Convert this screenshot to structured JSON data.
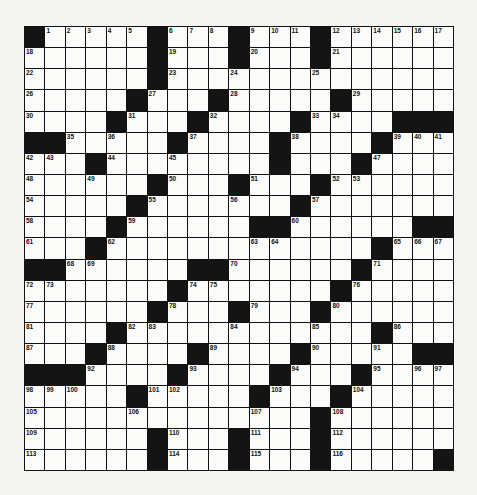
{
  "puzzle": {
    "rows": 21,
    "cols": 21,
    "grid": [
      "#.....#...#...#......",
      "......#...#...#......",
      "......#..............",
      ".....#...#.....#.....",
      "....#...#....#....###",
      "##.....#....#....#...",
      "...#........#...#....",
      "......#...#...#......",
      ".....#.......#.......",
      "....#......##......##",
      "...#.............#...",
      "##......##......#....",
      ".......#.......#.....",
      "......#...#...#......",
      "....#............#...",
      "...#....#....#.....##",
      "###....#....#...#....",
      ".....#.....#...#.....",
      "..............#......",
      "......#...#...#......",
      "......#...#...#.....#"
    ],
    "numbers": [
      {
        "r": 0,
        "c": 1,
        "n": "1"
      },
      {
        "r": 0,
        "c": 2,
        "n": "2"
      },
      {
        "r": 0,
        "c": 3,
        "n": "3"
      },
      {
        "r": 0,
        "c": 4,
        "n": "4"
      },
      {
        "r": 0,
        "c": 5,
        "n": "5"
      },
      {
        "r": 0,
        "c": 7,
        "n": "6"
      },
      {
        "r": 0,
        "c": 8,
        "n": "7"
      },
      {
        "r": 0,
        "c": 9,
        "n": "8"
      },
      {
        "r": 0,
        "c": 11,
        "n": "9"
      },
      {
        "r": 0,
        "c": 12,
        "n": "10"
      },
      {
        "r": 0,
        "c": 13,
        "n": "11"
      },
      {
        "r": 0,
        "c": 15,
        "n": "12"
      },
      {
        "r": 0,
        "c": 16,
        "n": "13"
      },
      {
        "r": 0,
        "c": 17,
        "n": "14"
      },
      {
        "r": 0,
        "c": 18,
        "n": "15"
      },
      {
        "r": 0,
        "c": 19,
        "n": "16"
      },
      {
        "r": 0,
        "c": 20,
        "n": "17"
      },
      {
        "r": 1,
        "c": 0,
        "n": "18"
      },
      {
        "r": 1,
        "c": 7,
        "n": "19"
      },
      {
        "r": 1,
        "c": 11,
        "n": "20"
      },
      {
        "r": 1,
        "c": 15,
        "n": "21"
      },
      {
        "r": 2,
        "c": 0,
        "n": "22"
      },
      {
        "r": 2,
        "c": 7,
        "n": "23"
      },
      {
        "r": 2,
        "c": 10,
        "n": "24"
      },
      {
        "r": 2,
        "c": 14,
        "n": "25"
      },
      {
        "r": 3,
        "c": 0,
        "n": "26"
      },
      {
        "r": 3,
        "c": 6,
        "n": "27"
      },
      {
        "r": 3,
        "c": 10,
        "n": "28"
      },
      {
        "r": 3,
        "c": 16,
        "n": "29"
      },
      {
        "r": 4,
        "c": 0,
        "n": "30"
      },
      {
        "r": 4,
        "c": 5,
        "n": "31"
      },
      {
        "r": 4,
        "c": 9,
        "n": "32"
      },
      {
        "r": 4,
        "c": 14,
        "n": "33"
      },
      {
        "r": 4,
        "c": 15,
        "n": "34"
      },
      {
        "r": 5,
        "c": 2,
        "n": "35"
      },
      {
        "r": 5,
        "c": 4,
        "n": "36"
      },
      {
        "r": 5,
        "c": 8,
        "n": "37"
      },
      {
        "r": 5,
        "c": 13,
        "n": "38"
      },
      {
        "r": 5,
        "c": 18,
        "n": "39"
      },
      {
        "r": 5,
        "c": 19,
        "n": "40"
      },
      {
        "r": 5,
        "c": 20,
        "n": "41"
      },
      {
        "r": 6,
        "c": 0,
        "n": "42"
      },
      {
        "r": 6,
        "c": 1,
        "n": "43"
      },
      {
        "r": 6,
        "c": 4,
        "n": "44"
      },
      {
        "r": 6,
        "c": 7,
        "n": "45"
      },
      {
        "r": 6,
        "c": 12,
        "n": "46"
      },
      {
        "r": 6,
        "c": 17,
        "n": "47"
      },
      {
        "r": 7,
        "c": 0,
        "n": "48"
      },
      {
        "r": 7,
        "c": 3,
        "n": "49"
      },
      {
        "r": 7,
        "c": 7,
        "n": "50"
      },
      {
        "r": 7,
        "c": 11,
        "n": "51"
      },
      {
        "r": 7,
        "c": 15,
        "n": "52"
      },
      {
        "r": 7,
        "c": 16,
        "n": "53"
      },
      {
        "r": 8,
        "c": 0,
        "n": "54"
      },
      {
        "r": 8,
        "c": 6,
        "n": "55"
      },
      {
        "r": 8,
        "c": 10,
        "n": "56"
      },
      {
        "r": 8,
        "c": 14,
        "n": "57"
      },
      {
        "r": 9,
        "c": 0,
        "n": "58"
      },
      {
        "r": 9,
        "c": 5,
        "n": "59"
      },
      {
        "r": 9,
        "c": 13,
        "n": "60"
      },
      {
        "r": 10,
        "c": 0,
        "n": "61"
      },
      {
        "r": 10,
        "c": 4,
        "n": "62"
      },
      {
        "r": 10,
        "c": 11,
        "n": "63"
      },
      {
        "r": 10,
        "c": 12,
        "n": "64"
      },
      {
        "r": 10,
        "c": 18,
        "n": "65"
      },
      {
        "r": 10,
        "c": 19,
        "n": "66"
      },
      {
        "r": 10,
        "c": 20,
        "n": "67"
      },
      {
        "r": 11,
        "c": 2,
        "n": "68"
      },
      {
        "r": 11,
        "c": 3,
        "n": "69"
      },
      {
        "r": 11,
        "c": 10,
        "n": "70"
      },
      {
        "r": 11,
        "c": 17,
        "n": "71"
      },
      {
        "r": 12,
        "c": 0,
        "n": "72"
      },
      {
        "r": 12,
        "c": 1,
        "n": "73"
      },
      {
        "r": 12,
        "c": 8,
        "n": "74"
      },
      {
        "r": 12,
        "c": 9,
        "n": "75"
      },
      {
        "r": 12,
        "c": 16,
        "n": "76"
      },
      {
        "r": 13,
        "c": 0,
        "n": "77"
      },
      {
        "r": 13,
        "c": 7,
        "n": "78"
      },
      {
        "r": 13,
        "c": 11,
        "n": "79"
      },
      {
        "r": 13,
        "c": 15,
        "n": "80"
      },
      {
        "r": 14,
        "c": 0,
        "n": "81"
      },
      {
        "r": 14,
        "c": 5,
        "n": "82"
      },
      {
        "r": 14,
        "c": 6,
        "n": "83"
      },
      {
        "r": 14,
        "c": 10,
        "n": "84"
      },
      {
        "r": 14,
        "c": 14,
        "n": "85"
      },
      {
        "r": 14,
        "c": 18,
        "n": "86"
      },
      {
        "r": 15,
        "c": 0,
        "n": "87"
      },
      {
        "r": 15,
        "c": 4,
        "n": "88"
      },
      {
        "r": 15,
        "c": 9,
        "n": "89"
      },
      {
        "r": 15,
        "c": 14,
        "n": "90"
      },
      {
        "r": 15,
        "c": 17,
        "n": "91"
      },
      {
        "r": 16,
        "c": 3,
        "n": "92"
      },
      {
        "r": 16,
        "c": 8,
        "n": "93"
      },
      {
        "r": 16,
        "c": 13,
        "n": "94"
      },
      {
        "r": 16,
        "c": 17,
        "n": "95"
      },
      {
        "r": 16,
        "c": 19,
        "n": "96"
      },
      {
        "r": 16,
        "c": 20,
        "n": "97"
      },
      {
        "r": 17,
        "c": 0,
        "n": "98"
      },
      {
        "r": 17,
        "c": 1,
        "n": "99"
      },
      {
        "r": 17,
        "c": 2,
        "n": "100"
      },
      {
        "r": 17,
        "c": 6,
        "n": "101"
      },
      {
        "r": 17,
        "c": 7,
        "n": "102"
      },
      {
        "r": 17,
        "c": 12,
        "n": "103"
      },
      {
        "r": 17,
        "c": 16,
        "n": "104"
      },
      {
        "r": 18,
        "c": 0,
        "n": "105"
      },
      {
        "r": 18,
        "c": 5,
        "n": "106"
      },
      {
        "r": 18,
        "c": 11,
        "n": "107"
      },
      {
        "r": 18,
        "c": 15,
        "n": "108"
      },
      {
        "r": 19,
        "c": 0,
        "n": "109"
      },
      {
        "r": 19,
        "c": 7,
        "n": "110"
      },
      {
        "r": 19,
        "c": 11,
        "n": "111"
      },
      {
        "r": 19,
        "c": 15,
        "n": "112"
      },
      {
        "r": 20,
        "c": 0,
        "n": "113"
      },
      {
        "r": 20,
        "c": 7,
        "n": "114"
      },
      {
        "r": 20,
        "c": 11,
        "n": "115"
      },
      {
        "r": 20,
        "c": 15,
        "n": "116"
      }
    ]
  },
  "colors": {
    "block": "#141414",
    "cell": "#fbfbfa",
    "background": "#f4f4f2",
    "line": "#111111"
  }
}
